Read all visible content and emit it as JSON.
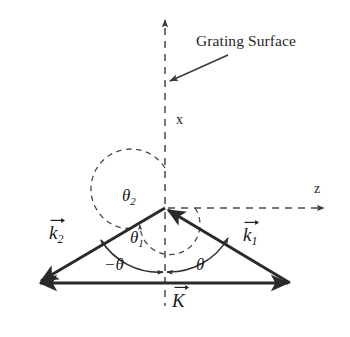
{
  "figure": {
    "background_color": "#ffffff",
    "stroke_color": "#2a2a2a",
    "dash_color": "#4a4a4a"
  },
  "annotations": {
    "grating_surface": "Grating Surface",
    "axis_x": "x",
    "axis_z": "z"
  },
  "vectors": [
    {
      "id": "k2",
      "symbol": "k",
      "subscript": "2",
      "label": "k⃗₂",
      "from": [
        165,
        208
      ],
      "to": [
        38,
        283
      ],
      "arrow_at": "to"
    },
    {
      "id": "k1",
      "symbol": "k",
      "subscript": "1",
      "label": "k⃗₁",
      "from": [
        290,
        283
      ],
      "to": [
        165,
        208
      ],
      "arrow_at": "to"
    },
    {
      "id": "K",
      "symbol": "K",
      "subscript": "",
      "label": "K⃗",
      "from": [
        38,
        283
      ],
      "to": [
        290,
        283
      ],
      "arrow_at": "both"
    }
  ],
  "angles": [
    {
      "id": "theta2",
      "symbol": "θ",
      "subscript": "2",
      "label": "θ₂",
      "style": "dashed",
      "arc": "outer",
      "from_axis": "+x",
      "to_vector": "k2"
    },
    {
      "id": "theta1",
      "symbol": "θ",
      "subscript": "1",
      "label": "θ₁",
      "style": "dashed",
      "arc": "inner",
      "from_axis": "+x",
      "to_vector": "k2"
    },
    {
      "id": "theta_neg",
      "symbol": "−θ",
      "subscript": "",
      "label": "−θ",
      "style": "solid",
      "arc": "lower-left",
      "from_axis": "−x",
      "to_vector": "k2"
    },
    {
      "id": "theta_pos",
      "symbol": "θ",
      "subscript": "",
      "label": "θ",
      "style": "solid",
      "arc": "lower-right",
      "from_axis": "−x",
      "to_vector": "k1"
    }
  ],
  "axes": {
    "origin": [
      165,
      208
    ],
    "x_axis": {
      "label": "x",
      "direction": "up",
      "style": "dashed",
      "tip": [
        165,
        12
      ]
    },
    "z_axis": {
      "label": "z",
      "direction": "right",
      "style": "dashed",
      "tip": [
        332,
        208
      ]
    },
    "x_axis_below": {
      "style": "dashed",
      "end": [
        165,
        306
      ]
    }
  }
}
